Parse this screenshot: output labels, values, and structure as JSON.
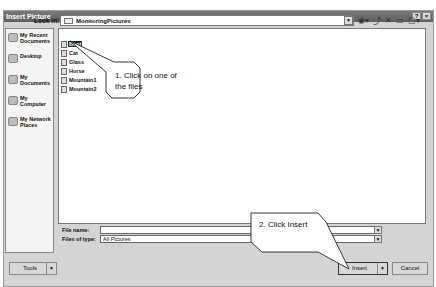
{
  "window": {
    "title": "Insert Picture",
    "help_button": "?",
    "close_button": "×"
  },
  "lookin": {
    "label": "Look in:",
    "value": "MonitoringPictures"
  },
  "toolbar": {
    "icons": [
      "back-icon",
      "up-folder-icon",
      "delete-icon",
      "new-folder-icon",
      "views-icon"
    ]
  },
  "places": [
    {
      "label": "My Recent Documents",
      "icon": "recent-documents-icon"
    },
    {
      "label": "Desktop",
      "icon": "desktop-icon"
    },
    {
      "label": "My Documents",
      "icon": "my-documents-icon"
    },
    {
      "label": "My Computer",
      "icon": "my-computer-icon"
    },
    {
      "label": "My Network Places",
      "icon": "network-places-icon"
    }
  ],
  "files": [
    {
      "name": "Boat",
      "selected": true
    },
    {
      "name": "Cat",
      "selected": false
    },
    {
      "name": "Glass",
      "selected": false
    },
    {
      "name": "Horse",
      "selected": false
    },
    {
      "name": "Mountain1",
      "selected": false
    },
    {
      "name": "Mountain2",
      "selected": false
    }
  ],
  "filename": {
    "label": "File name:",
    "value": ""
  },
  "filetype": {
    "label": "Files of type:",
    "value": "All Pictures"
  },
  "buttons": {
    "tools": "Tools",
    "insert": "Insert",
    "cancel": "Cancel"
  },
  "callouts": {
    "step1_line1": "1. Click on one of",
    "step1_line2": "the files",
    "step2": "2. Click Insert"
  }
}
